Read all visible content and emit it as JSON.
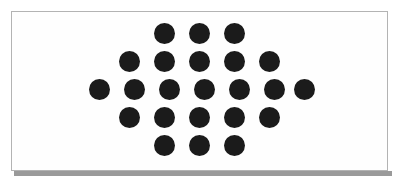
{
  "image": {
    "width": 402,
    "height": 186,
    "background_color": "#ffffff",
    "description": "Black dots arranged in a diamond (rhombus) pattern on a white bordered panel"
  },
  "panel": {
    "background_color": "#fefefe",
    "border_color": "#b3b3b3",
    "shadow_color": "#9a9a9a",
    "left": 11,
    "top": 11,
    "width": 377,
    "height": 160
  },
  "dot_pattern": {
    "shape": "diamond",
    "dot_color": "#1b1b1b",
    "dot_diameter": 21,
    "column_spacing": 35,
    "row_spacing": 28,
    "total_dots": 23,
    "rows": [
      {
        "index": 1,
        "count": 3,
        "center_y": 32,
        "start_center_x": 163,
        "centers_x": [
          163,
          198,
          233
        ]
      },
      {
        "index": 2,
        "count": 5,
        "center_y": 60,
        "start_center_x": 128,
        "centers_x": [
          128,
          163,
          198,
          233,
          268
        ]
      },
      {
        "index": 3,
        "count": 7,
        "center_y": 88,
        "start_center_x": 98,
        "centers_x": [
          98,
          133,
          168,
          203,
          238,
          273,
          303
        ]
      },
      {
        "index": 4,
        "count": 5,
        "center_y": 116,
        "start_center_x": 128,
        "centers_x": [
          128,
          163,
          198,
          233,
          268
        ]
      },
      {
        "index": 5,
        "count": 3,
        "center_y": 144,
        "start_center_x": 163,
        "centers_x": [
          163,
          198,
          233
        ]
      }
    ]
  }
}
